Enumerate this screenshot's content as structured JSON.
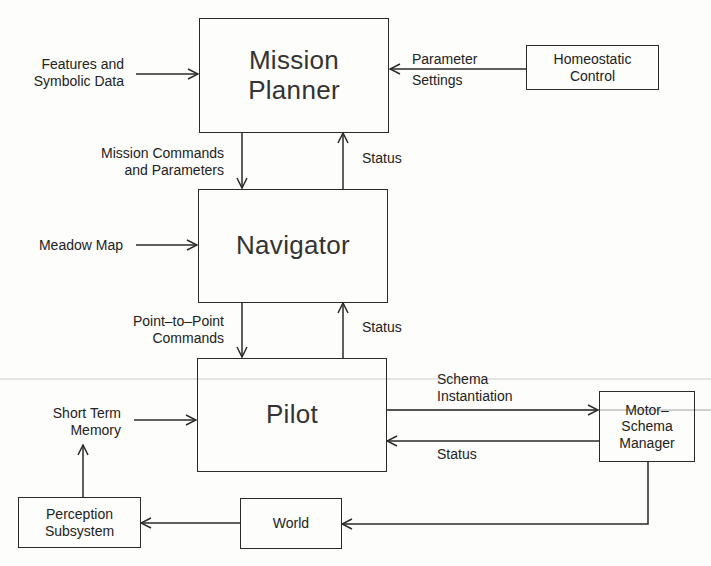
{
  "diagram": {
    "nodes": {
      "mission_planner": {
        "line1": "Mission",
        "line2": "Planner"
      },
      "navigator": {
        "label": "Navigator"
      },
      "pilot": {
        "label": "Pilot"
      },
      "homeostatic_control": {
        "line1": "Homeostatic",
        "line2": "Control"
      },
      "motor_schema_manager": {
        "line1": "Motor–",
        "line2": "Schema",
        "line3": "Manager"
      },
      "perception_subsystem": {
        "line1": "Perception",
        "line2": "Subsystem"
      },
      "world": {
        "label": "World"
      }
    },
    "edge_labels": {
      "features": {
        "line1": "Features and",
        "line2": "Symbolic Data"
      },
      "parameter_settings": {
        "line1": "Parameter",
        "line2": "Settings"
      },
      "mission_commands": {
        "line1": "Mission Commands",
        "line2": "and Parameters"
      },
      "status_planner": "Status",
      "meadow_map": "Meadow Map",
      "point_to_point": {
        "line1": "Point–to–Point",
        "line2": "Commands"
      },
      "status_navigator": "Status",
      "short_term_memory": {
        "line1": "Short Term",
        "line2": "Memory"
      },
      "schema_instantiation": {
        "line1": "Schema",
        "line2": "Instantiation"
      },
      "status_pilot": "Status"
    },
    "edges": [
      {
        "from": "Features and Symbolic Data",
        "to": "Mission Planner"
      },
      {
        "from": "Homeostatic Control",
        "to": "Mission Planner",
        "label": "Parameter Settings"
      },
      {
        "from": "Mission Planner",
        "to": "Navigator",
        "label": "Mission Commands and Parameters"
      },
      {
        "from": "Navigator",
        "to": "Mission Planner",
        "label": "Status"
      },
      {
        "from": "Meadow Map",
        "to": "Navigator"
      },
      {
        "from": "Navigator",
        "to": "Pilot",
        "label": "Point-to-Point Commands"
      },
      {
        "from": "Pilot",
        "to": "Navigator",
        "label": "Status"
      },
      {
        "from": "Short Term Memory",
        "to": "Pilot"
      },
      {
        "from": "Pilot",
        "to": "Motor-Schema Manager",
        "label": "Schema Instantiation"
      },
      {
        "from": "Motor-Schema Manager",
        "to": "Pilot",
        "label": "Status"
      },
      {
        "from": "Motor-Schema Manager",
        "to": "World"
      },
      {
        "from": "World",
        "to": "Perception Subsystem"
      },
      {
        "from": "Perception Subsystem",
        "to": "Short Term Memory"
      }
    ]
  }
}
